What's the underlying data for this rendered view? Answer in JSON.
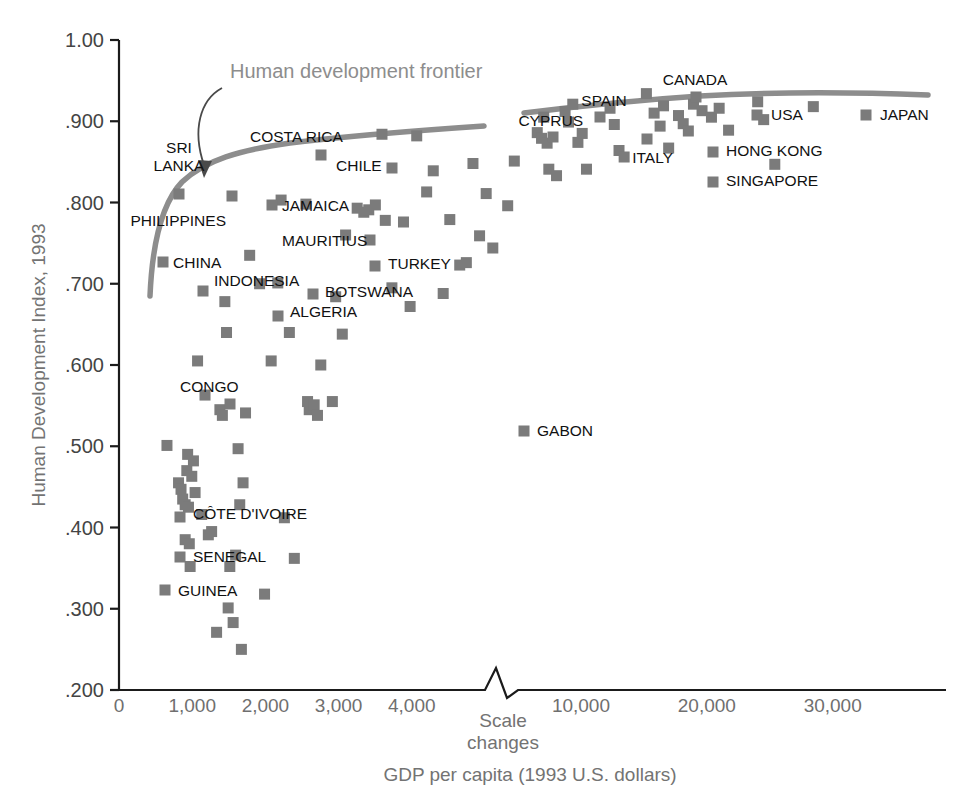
{
  "chart_data": {
    "type": "scatter",
    "title": "",
    "xlabel": "GDP per capita (1993 U.S. dollars)",
    "ylabel": "Human Development Index, 1993",
    "ylim": [
      0.2,
      1.0
    ],
    "grid": false,
    "legend": "none",
    "axis_note": "Scale changes",
    "annotation": "Human development frontier",
    "y_ticks": [
      ".200",
      ".300",
      ".400",
      ".500",
      ".600",
      ".700",
      ".800",
      ".900",
      "1.00"
    ],
    "y_tick_values": [
      0.2,
      0.3,
      0.4,
      0.5,
      0.6,
      0.7,
      0.8,
      0.9,
      1.0
    ],
    "x_ticks_lower": [
      "0",
      "1,000",
      "2,000",
      "3,000",
      "4,000"
    ],
    "x_tick_values_lower": [
      0,
      1000,
      2000,
      3000,
      4000
    ],
    "x_ticks_upper": [
      "10,000",
      "20,000",
      "30,000"
    ],
    "x_tick_values_upper": [
      10000,
      20000,
      30000
    ],
    "x_scale_break": true,
    "labeled_points": [
      {
        "label": "SRI LANKA",
        "x": 3030,
        "y": 0.804
      },
      {
        "label": "PHILIPPINES",
        "x": 2700,
        "y": 0.665
      },
      {
        "label": "CHINA",
        "x": 2330,
        "y": 0.609
      },
      {
        "label": "INDONESIA",
        "x": 3270,
        "y": 0.586
      },
      {
        "label": "COSTA RICA",
        "x": 5680,
        "y": 0.884
      },
      {
        "label": "JAMAICA",
        "x": 3670,
        "y": 0.749
      },
      {
        "label": "MAURITIUS",
        "x": 12510,
        "y": 0.825
      },
      {
        "label": "ALGERIA",
        "x": 5570,
        "y": 0.746
      },
      {
        "label": "BOTSWANA",
        "x": 5220,
        "y": 0.741
      },
      {
        "label": "CHILE",
        "x": 8900,
        "y": 0.882
      },
      {
        "label": "TURKEY",
        "x": 5190,
        "y": 0.711
      },
      {
        "label": "CONGO",
        "x": 2750,
        "y": 0.517
      },
      {
        "label": "CÔTE D'IVOIRE",
        "x": 1620,
        "y": 0.357
      },
      {
        "label": "SENEGAL",
        "x": 1710,
        "y": 0.331
      },
      {
        "label": "GUINEA",
        "x": 1800,
        "y": 0.306
      },
      {
        "label": "GABON",
        "x": 3861,
        "y": 0.562
      },
      {
        "label": "CYPRUS",
        "x": 14060,
        "y": 0.907
      },
      {
        "label": "SPAIN",
        "x": 13660,
        "y": 0.933
      },
      {
        "label": "ITALY",
        "x": 18160,
        "y": 0.914
      },
      {
        "label": "CANADA",
        "x": 20950,
        "y": 0.951
      },
      {
        "label": "HONG KONG",
        "x": 21560,
        "y": 0.909
      },
      {
        "label": "SINGAPORE",
        "x": 19350,
        "y": 0.881
      },
      {
        "label": "USA",
        "x": 24680,
        "y": 0.94
      },
      {
        "label": "JAPAN",
        "x": 20660,
        "y": 0.938
      }
    ],
    "points_lower_panel": [
      [
        0.058,
        0.501
      ],
      [
        0.072,
        0.455
      ],
      [
        0.075,
        0.447
      ],
      [
        0.077,
        0.435
      ],
      [
        0.08,
        0.428
      ],
      [
        0.08,
        0.385
      ],
      [
        0.082,
        0.47
      ],
      [
        0.083,
        0.49
      ],
      [
        0.084,
        0.425
      ],
      [
        0.085,
        0.38
      ],
      [
        0.086,
        0.352
      ],
      [
        0.088,
        0.463
      ],
      [
        0.09,
        0.482
      ],
      [
        0.092,
        0.443
      ],
      [
        0.095,
        0.605
      ],
      [
        0.1,
        0.416
      ],
      [
        0.104,
        0.563
      ],
      [
        0.108,
        0.391
      ],
      [
        0.112,
        0.395
      ],
      [
        0.118,
        0.271
      ],
      [
        0.122,
        0.545
      ],
      [
        0.125,
        0.538
      ],
      [
        0.128,
        0.678
      ],
      [
        0.13,
        0.64
      ],
      [
        0.132,
        0.301
      ],
      [
        0.134,
        0.352
      ],
      [
        0.138,
        0.283
      ],
      [
        0.141,
        0.366
      ],
      [
        0.144,
        0.497
      ],
      [
        0.146,
        0.428
      ],
      [
        0.148,
        0.25
      ],
      [
        0.15,
        0.455
      ],
      [
        0.153,
        0.541
      ],
      [
        0.158,
        0.735
      ],
      [
        0.17,
        0.7
      ],
      [
        0.176,
        0.318
      ],
      [
        0.184,
        0.605
      ],
      [
        0.192,
        0.701
      ],
      [
        0.196,
        0.803
      ],
      [
        0.2,
        0.412
      ],
      [
        0.206,
        0.64
      ],
      [
        0.212,
        0.362
      ],
      [
        0.226,
        0.798
      ],
      [
        0.228,
        0.555
      ],
      [
        0.23,
        0.545
      ],
      [
        0.236,
        0.551
      ],
      [
        0.24,
        0.538
      ],
      [
        0.244,
        0.6
      ],
      [
        0.258,
        0.555
      ],
      [
        0.262,
        0.684
      ],
      [
        0.27,
        0.638
      ],
      [
        0.274,
        0.76
      ],
      [
        0.288,
        0.793
      ],
      [
        0.296,
        0.788
      ],
      [
        0.302,
        0.791
      ],
      [
        0.31,
        0.797
      ],
      [
        0.318,
        0.884
      ],
      [
        0.322,
        0.778
      ],
      [
        0.33,
        0.695
      ],
      [
        0.344,
        0.776
      ],
      [
        0.352,
        0.672
      ],
      [
        0.36,
        0.882
      ],
      [
        0.372,
        0.813
      ],
      [
        0.38,
        0.839
      ],
      [
        0.392,
        0.688
      ],
      [
        0.4,
        0.779
      ],
      [
        0.412,
        0.723
      ],
      [
        0.42,
        0.726
      ],
      [
        0.428,
        0.848
      ],
      [
        0.436,
        0.759
      ],
      [
        0.444,
        0.811
      ],
      [
        0.452,
        0.744
      ],
      [
        0.47,
        0.796
      ],
      [
        0.478,
        0.851
      ]
    ]
  }
}
